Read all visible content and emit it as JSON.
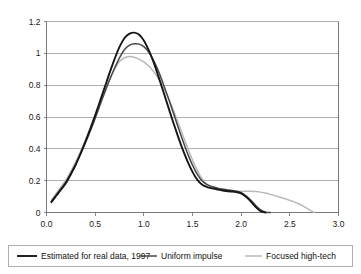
{
  "chart_data": {
    "type": "line",
    "title": "",
    "subtitle": "",
    "xlabel": "",
    "ylabel": "",
    "xlim": [
      0.0,
      3.0
    ],
    "ylim": [
      0.0,
      1.2
    ],
    "grid": "horizontal",
    "legend_position": "bottom",
    "x_ticks": [
      "0.0",
      "0.5",
      "1.0",
      "1.5",
      "2.0",
      "2.5",
      "3.0"
    ],
    "x_tick_values": [
      0.0,
      0.5,
      1.0,
      1.5,
      2.0,
      2.5,
      3.0
    ],
    "y_ticks": [
      "0",
      "0.2",
      "0.4",
      "0.6",
      "0.8",
      "1",
      "1.2"
    ],
    "y_tick_values": [
      0,
      0.2,
      0.4,
      0.6,
      0.8,
      1.0,
      1.2
    ],
    "x": [
      0.05,
      0.1,
      0.15,
      0.2,
      0.25,
      0.3,
      0.35,
      0.4,
      0.45,
      0.5,
      0.55,
      0.6,
      0.65,
      0.7,
      0.75,
      0.8,
      0.85,
      0.9,
      0.95,
      1.0,
      1.05,
      1.1,
      1.15,
      1.2,
      1.25,
      1.3,
      1.35,
      1.4,
      1.45,
      1.5,
      1.55,
      1.6,
      1.65,
      1.7,
      1.75,
      1.8,
      1.85,
      1.9,
      1.95,
      2.0,
      2.05,
      2.1,
      2.15,
      2.2,
      2.25,
      2.3,
      2.4,
      2.5,
      2.6,
      2.7,
      2.75
    ],
    "series": [
      {
        "name": "Estimated for real data, 1997",
        "color": "#161616",
        "width": 1.9,
        "values": [
          0.065,
          0.105,
          0.145,
          0.185,
          0.24,
          0.3,
          0.37,
          0.445,
          0.525,
          0.61,
          0.7,
          0.79,
          0.88,
          0.965,
          1.04,
          1.095,
          1.122,
          1.13,
          1.118,
          1.08,
          1.02,
          0.945,
          0.855,
          0.76,
          0.665,
          0.57,
          0.48,
          0.395,
          0.32,
          0.255,
          0.205,
          0.175,
          0.16,
          0.152,
          0.146,
          0.14,
          0.135,
          0.132,
          0.128,
          0.12,
          0.098,
          0.068,
          0.034,
          0.008,
          0.0,
          0.0,
          0.0,
          0.0,
          0.0,
          0.0,
          0.0
        ]
      },
      {
        "name": "Uniform impulse",
        "color": "#474747",
        "width": 1.5,
        "values": [
          0.07,
          0.11,
          0.15,
          0.192,
          0.245,
          0.303,
          0.368,
          0.438,
          0.512,
          0.592,
          0.675,
          0.757,
          0.836,
          0.908,
          0.972,
          1.022,
          1.05,
          1.06,
          1.058,
          1.042,
          1.008,
          0.956,
          0.888,
          0.808,
          0.722,
          0.632,
          0.54,
          0.452,
          0.37,
          0.298,
          0.24,
          0.198,
          0.175,
          0.163,
          0.155,
          0.148,
          0.143,
          0.139,
          0.134,
          0.125,
          0.104,
          0.076,
          0.044,
          0.016,
          0.002,
          0.0,
          0.0,
          0.0,
          0.0,
          0.0,
          0.0
        ]
      },
      {
        "name": "Focused high-tech",
        "color": "#b9b9b9",
        "width": 1.5,
        "values": [
          0.078,
          0.12,
          0.162,
          0.205,
          0.258,
          0.318,
          0.385,
          0.455,
          0.53,
          0.608,
          0.688,
          0.765,
          0.838,
          0.9,
          0.948,
          0.972,
          0.98,
          0.976,
          0.964,
          0.946,
          0.92,
          0.886,
          0.842,
          0.788,
          0.722,
          0.648,
          0.568,
          0.486,
          0.406,
          0.33,
          0.264,
          0.21,
          0.176,
          0.156,
          0.145,
          0.138,
          0.134,
          0.132,
          0.132,
          0.133,
          0.134,
          0.134,
          0.132,
          0.128,
          0.122,
          0.114,
          0.096,
          0.076,
          0.052,
          0.018,
          0.0
        ]
      }
    ],
    "legend": [
      {
        "label": "Estimated for real data, 1997",
        "color": "#161616",
        "width": 1.9
      },
      {
        "label": "Uniform impulse",
        "color": "#474747",
        "width": 1.5
      },
      {
        "label": "Focused high-tech",
        "color": "#b9b9b9",
        "width": 1.5
      }
    ]
  }
}
